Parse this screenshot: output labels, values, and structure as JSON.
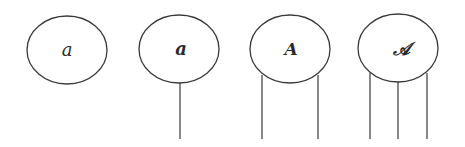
{
  "diagram": {
    "stroke_color": "#3a3a3a",
    "nodes": [
      {
        "label": "a",
        "style": "italic",
        "cx": 67,
        "cy": 50,
        "rx": 40,
        "ry": 34,
        "legs": []
      },
      {
        "label": "a",
        "style": "bold-italic",
        "cx": 179,
        "cy": 49,
        "rx": 40,
        "ry": 34,
        "legs": [
          180
        ]
      },
      {
        "label": "A",
        "style": "bold-italic",
        "cx": 290,
        "cy": 49,
        "rx": 40,
        "ry": 34,
        "legs": [
          262,
          318
        ]
      },
      {
        "label": "𝒜",
        "style": "script",
        "cx": 398,
        "cy": 48,
        "rx": 40,
        "ry": 34,
        "legs": [
          370,
          398,
          427
        ]
      }
    ]
  }
}
